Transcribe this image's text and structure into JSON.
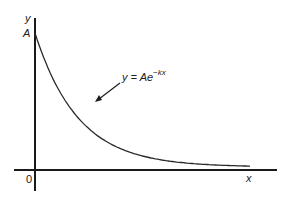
{
  "chart_data": {
    "type": "line",
    "title": "",
    "xlabel": "x",
    "ylabel": "y",
    "origin_label": "0",
    "y_intercept_label": "A",
    "series": [
      {
        "name": "y = Ae^-kx",
        "function": "A*exp(-k*x)",
        "x": [
          0,
          0.5,
          1,
          1.5,
          2,
          2.5,
          3,
          3.5,
          4,
          4.5,
          5
        ],
        "values": [
          1.0,
          0.61,
          0.37,
          0.22,
          0.14,
          0.08,
          0.05,
          0.03,
          0.02,
          0.01,
          0.007
        ]
      }
    ],
    "annotations": [
      {
        "text": "y = Ae",
        "superscript": "−kx",
        "arrow_to": "curve"
      }
    ],
    "grid": false,
    "legend": "none"
  },
  "labels": {
    "y_axis": "y",
    "x_axis": "x",
    "origin": "0",
    "intercept": "A",
    "equation_base": "y = Ae",
    "equation_exp": "−kx"
  },
  "colors": {
    "axis": "#1a1a1a",
    "curve": "#2a2a2a",
    "background": "#ffffff"
  }
}
